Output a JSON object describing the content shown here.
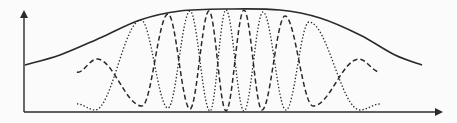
{
  "figure": {
    "colors": {
      "background": "#fbfbfb",
      "ink": "#2a2a2a"
    },
    "axes": {
      "y_axis": {
        "x": 24,
        "y_top": 12,
        "y_bottom": 112,
        "arrow": "up"
      },
      "x_axis": {
        "y": 112,
        "x_left": 24,
        "x_right": 441,
        "arrow": "right"
      },
      "labels": []
    },
    "envelope": {
      "style": "solid",
      "points": [
        [
          25,
          65
        ],
        [
          60,
          55
        ],
        [
          100,
          38
        ],
        [
          140,
          20
        ],
        [
          180,
          11
        ],
        [
          230,
          9
        ],
        [
          280,
          10
        ],
        [
          320,
          18
        ],
        [
          360,
          35
        ],
        [
          395,
          55
        ],
        [
          422,
          65
        ]
      ]
    },
    "dashed_wave": {
      "style": "dashed",
      "points": [
        [
          77,
          72
        ],
        [
          97,
          59
        ],
        [
          142,
          106
        ],
        [
          168,
          14
        ],
        [
          190,
          109
        ],
        [
          209,
          11
        ],
        [
          226,
          111
        ],
        [
          244,
          10
        ],
        [
          262,
          110
        ],
        [
          285,
          16
        ],
        [
          313,
          106
        ],
        [
          359,
          59
        ],
        [
          380,
          72
        ]
      ]
    },
    "dotted_wave": {
      "style": "dotted",
      "points": [
        [
          77,
          104
        ],
        [
          95,
          110
        ],
        [
          141,
          20
        ],
        [
          168,
          108
        ],
        [
          190,
          11
        ],
        [
          210,
          111
        ],
        [
          226,
          10
        ],
        [
          244,
          111
        ],
        [
          263,
          12
        ],
        [
          286,
          110
        ],
        [
          309,
          22
        ],
        [
          360,
          110
        ],
        [
          380,
          104
        ]
      ]
    }
  }
}
